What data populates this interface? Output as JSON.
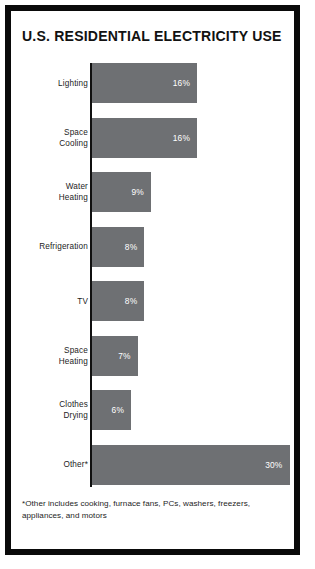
{
  "frame": {
    "border_color": "#0a0a0a",
    "background": "#ffffff"
  },
  "chart_data": {
    "type": "bar",
    "orientation": "horizontal",
    "title": "U.S. RESIDENTIAL ELECTRICITY USE",
    "xlabel": "",
    "ylabel": "",
    "xlim": [
      0,
      30
    ],
    "grid": false,
    "legend": "none",
    "bar_color": "#6e7073",
    "value_suffix": "%",
    "categories": [
      "Lighting",
      "Space Cooling",
      "Water Heating",
      "Refrigeration",
      "TV",
      "Space Heating",
      "Clothes Drying",
      "Other*"
    ],
    "values": [
      16,
      16,
      9,
      8,
      8,
      7,
      6,
      30
    ],
    "value_labels": [
      "16%",
      "16%",
      "9%",
      "8%",
      "8%",
      "7%",
      "6%",
      "30%"
    ],
    "bars": [
      {
        "label_line1": "Lighting",
        "label_line2": "",
        "value": 16,
        "value_label": "16%"
      },
      {
        "label_line1": "Space",
        "label_line2": "Cooling",
        "value": 16,
        "value_label": "16%"
      },
      {
        "label_line1": "Water",
        "label_line2": "Heating",
        "value": 9,
        "value_label": "9%"
      },
      {
        "label_line1": "Refrigeration",
        "label_line2": "",
        "value": 8,
        "value_label": "8%"
      },
      {
        "label_line1": "TV",
        "label_line2": "",
        "value": 8,
        "value_label": "8%"
      },
      {
        "label_line1": "Space",
        "label_line2": "Heating",
        "value": 7,
        "value_label": "7%"
      },
      {
        "label_line1": "Clothes",
        "label_line2": "Drying",
        "value": 6,
        "value_label": "6%"
      },
      {
        "label_line1": "Other*",
        "label_line2": "",
        "value": 30,
        "value_label": "30%"
      }
    ],
    "footnote": "*Other includes cooking, furnace fans, PCs, washers, freezers, appliances, and motors"
  }
}
